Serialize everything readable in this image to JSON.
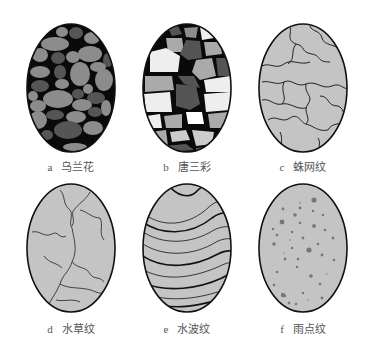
{
  "figure": {
    "panels": [
      {
        "id": "a",
        "letter": "a",
        "name": "乌兰花",
        "pattern": "pebbles-dark",
        "cx": 71,
        "cy": 88
      },
      {
        "id": "b",
        "letter": "b",
        "name": "唐三彩",
        "pattern": "pebbles-tricolor",
        "cx": 187,
        "cy": 88
      },
      {
        "id": "c",
        "letter": "c",
        "name": "蛛网纹",
        "pattern": "spiderweb-lines",
        "cx": 303,
        "cy": 88
      },
      {
        "id": "d",
        "letter": "d",
        "name": "水草纹",
        "pattern": "water-grass",
        "cx": 71,
        "cy": 248
      },
      {
        "id": "e",
        "letter": "e",
        "name": "水波纹",
        "pattern": "water-waves",
        "cx": 187,
        "cy": 248
      },
      {
        "id": "f",
        "letter": "f",
        "name": "雨点纹",
        "pattern": "raindrop-dots",
        "cx": 303,
        "cy": 248
      }
    ],
    "colors": {
      "outline": "#111111",
      "fill_gray": "#c4c4c4",
      "dark_matrix": "#0a0a0a",
      "pebble_gray": "#8c8c8c",
      "pebble_dark": "#555555",
      "pebble_light": "#eeeeee",
      "caption": "#555555"
    }
  }
}
